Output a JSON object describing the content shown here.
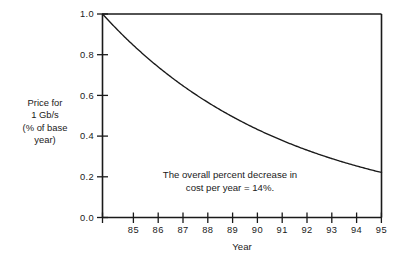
{
  "chart_data": {
    "type": "line",
    "title": "",
    "xlabel": "Year",
    "ylabel_lines": [
      "Price for",
      "1 Gb/s",
      "(% of base",
      "year)"
    ],
    "ylabel": "Price for 1 Gb/s (% of base year)",
    "x": [
      85,
      86,
      87,
      88,
      89,
      90,
      91,
      92,
      93,
      94,
      95
    ],
    "values": [
      1.0,
      0.86,
      0.74,
      0.636,
      0.547,
      0.47,
      0.405,
      0.348,
      0.299,
      0.257,
      0.221
    ],
    "series": [
      {
        "name": "Price for 1 Gb/s (% of base year)",
        "values": [
          1.0,
          0.86,
          0.74,
          0.636,
          0.547,
          0.47,
          0.405,
          0.348,
          0.299,
          0.257,
          0.221
        ]
      }
    ],
    "xlim": [
      84.45,
      95
    ],
    "ylim": [
      0.0,
      1.0
    ],
    "xticks": [
      85,
      86,
      87,
      88,
      89,
      90,
      91,
      92,
      93,
      94,
      95
    ],
    "xticklabels": [
      "85",
      "86",
      "87",
      "88",
      "89",
      "90",
      "91",
      "92",
      "93",
      "94",
      "95"
    ],
    "yticks": [
      0.0,
      0.2,
      0.4,
      0.6,
      0.8,
      1.0
    ],
    "yticklabels": [
      "0.0",
      "0.2",
      "0.4",
      "0.6",
      "0.8",
      "1.0"
    ],
    "grid": false,
    "legend": false,
    "legend_position": "none",
    "decay_rate_per_year": 0.14,
    "annotation_lines": [
      "The overall percent decrease in",
      "cost per year = 14%."
    ],
    "annotation": "The overall percent decrease in cost per year = 14%.",
    "line_color": "#1a1a1a",
    "axis_color": "#1a1a1a",
    "background_color": "#ffffff"
  },
  "axis": {
    "x_title": "Year",
    "x_labels": [
      "85",
      "86",
      "87",
      "88",
      "89",
      "90",
      "91",
      "92",
      "93",
      "94",
      "95"
    ],
    "y_labels": [
      "0.0",
      "0.2",
      "0.4",
      "0.6",
      "0.8",
      "1.0"
    ]
  },
  "ylabel": {
    "line1": "Price for",
    "line2": "1 Gb/s",
    "line3": "(% of base",
    "line4": "year)"
  },
  "annotation": {
    "line1": "The overall percent decrease in",
    "line2": "cost per year = 14%."
  }
}
